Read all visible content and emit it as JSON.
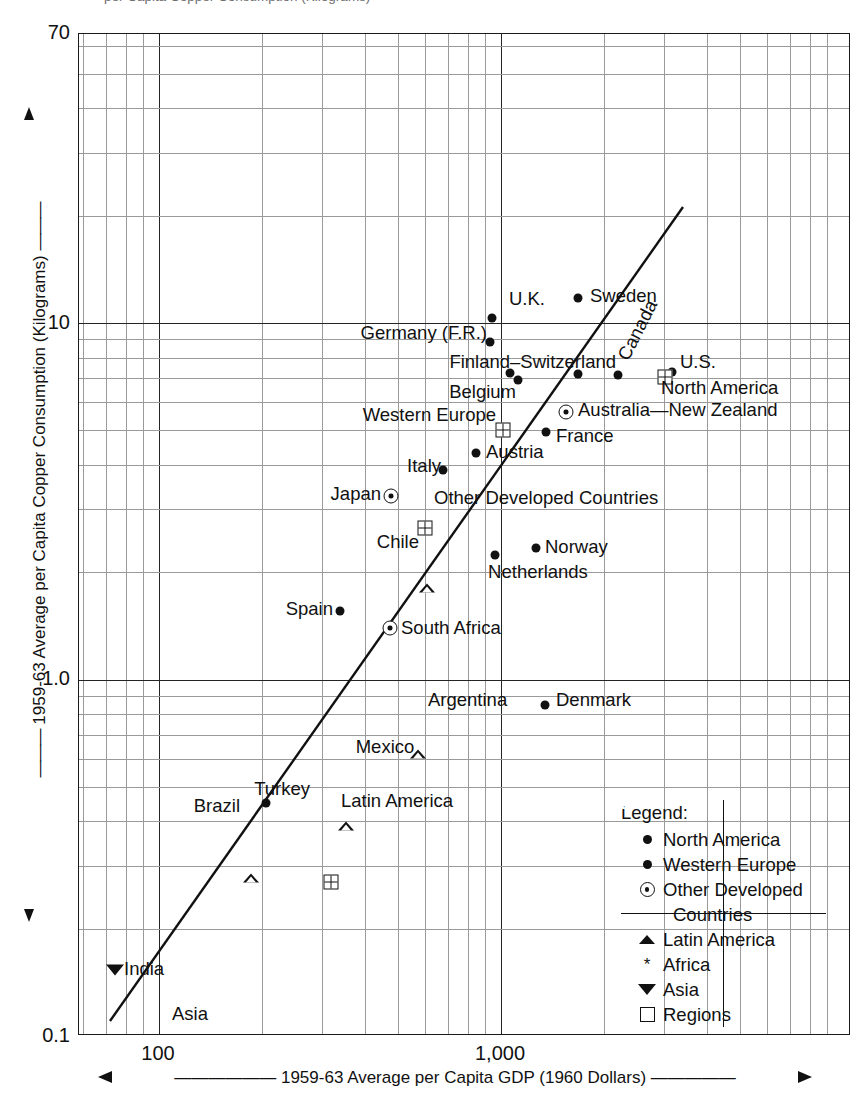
{
  "title_clipped": "per Capita Copper Consumption (Kilograms)",
  "axes": {
    "y_title": "1959-63 Average per Capita Copper Consumption (Kilograms)",
    "x_title": "1959-63 Average per Capita GDP (1960 Dollars)",
    "y_ticks": [
      "70",
      "10",
      "1.0",
      "0.1"
    ],
    "x_ticks": [
      "100",
      "1,000"
    ]
  },
  "legend": {
    "title": "Legend:",
    "items": [
      {
        "symbol": "filled-circle",
        "label": "North America"
      },
      {
        "symbol": "filled-circle",
        "label": "Western Europe"
      },
      {
        "symbol": "circle-dot",
        "label": "Other Developed"
      },
      {
        "symbol": "none",
        "label": "Countries"
      },
      {
        "symbol": "open-triangle",
        "label": "Latin America"
      },
      {
        "symbol": "asterisk",
        "label": "Africa"
      },
      {
        "symbol": "down-triangle",
        "label": "Asia"
      },
      {
        "symbol": "crossed-square",
        "label": "Regions"
      }
    ]
  },
  "chart_data": {
    "type": "scatter",
    "xlabel": "1959-63 Average per Capita GDP (1960 Dollars)",
    "ylabel": "1959-63 Average per Capita Copper Consumption (Kilograms)",
    "xscale": "log",
    "yscale": "log",
    "xlim": [
      72,
      3100
    ],
    "ylim": [
      0.1,
      70
    ],
    "grid": true,
    "legend_position": "inside-bottom-right",
    "trendline": {
      "x": [
        78,
        1840
      ],
      "y": [
        0.107,
        22.0
      ]
    },
    "points": [
      {
        "name": "Sweden",
        "group": "Western Europe",
        "symbol": "filled-circle",
        "x": 1600,
        "y": 11.3
      },
      {
        "name": "U.K.",
        "group": "Western Europe",
        "symbol": "filled-circle",
        "x": 1240,
        "y": 10.0
      },
      {
        "name": "Germany (F.R.)",
        "group": "Western Europe",
        "symbol": "filled-circle",
        "x": 1240,
        "y": 8.6
      },
      {
        "name": "Finland",
        "group": "Western Europe",
        "symbol": "filled-circle",
        "x": 1010,
        "y": 7.3
      },
      {
        "name": "Belgium",
        "group": "Western Europe",
        "symbol": "filled-circle",
        "x": 1070,
        "y": 7.0
      },
      {
        "name": "Switzerland",
        "group": "Western Europe",
        "symbol": "filled-circle",
        "x": 1400,
        "y": 7.2
      },
      {
        "name": "Canada",
        "group": "North America",
        "symbol": "filled-circle",
        "x": 1790,
        "y": 7.2
      },
      {
        "name": "U.S.",
        "group": "North America",
        "symbol": "filled-circle",
        "x": 2450,
        "y": 7.4
      },
      {
        "name": "North America",
        "group": "Regions",
        "symbol": "crossed-square",
        "x": 2330,
        "y": 7.0
      },
      {
        "name": "Western Europe",
        "group": "Regions",
        "symbol": "crossed-square",
        "x": 1070,
        "y": 5.7
      },
      {
        "name": "Australia-New Zealand",
        "group": "Other Developed",
        "symbol": "circle-dot",
        "x": 1540,
        "y": 5.7
      },
      {
        "name": "France",
        "group": "Western Europe",
        "symbol": "filled-circle",
        "x": 1460,
        "y": 5.0
      },
      {
        "name": "Austria",
        "group": "Western Europe",
        "symbol": "filled-circle",
        "x": 1000,
        "y": 4.2
      },
      {
        "name": "Italy",
        "group": "Western Europe",
        "symbol": "filled-circle",
        "x": 780,
        "y": 3.6
      },
      {
        "name": "Japan",
        "group": "Other Developed",
        "symbol": "circle-dot",
        "x": 490,
        "y": 3.2
      },
      {
        "name": "Other Developed Countries",
        "group": "Regions",
        "symbol": "crossed-square",
        "x": 640,
        "y": 3.2
      },
      {
        "name": "Chile",
        "group": "Latin America",
        "symbol": "open-triangle",
        "x": 560,
        "y": 2.35
      },
      {
        "name": "Norway",
        "group": "Western Europe",
        "symbol": "filled-circle",
        "x": 1260,
        "y": 2.35
      },
      {
        "name": "Netherlands",
        "group": "Western Europe",
        "symbol": "filled-circle",
        "x": 960,
        "y": 2.15
      },
      {
        "name": "Spain",
        "group": "Western Europe",
        "symbol": "filled-circle",
        "x": 350,
        "y": 1.55
      },
      {
        "name": "South Africa",
        "group": "Other Developed",
        "symbol": "circle-dot",
        "x": 430,
        "y": 1.33
      },
      {
        "name": "Argentina",
        "group": "Latin America",
        "symbol": "open-triangle",
        "x": 500,
        "y": 0.9
      },
      {
        "name": "Denmark",
        "group": "Western Europe",
        "symbol": "filled-circle",
        "x": 930,
        "y": 0.86
      },
      {
        "name": "Mexico",
        "group": "Latin America",
        "symbol": "open-triangle",
        "x": 345,
        "y": 0.62
      },
      {
        "name": "Turkey",
        "group": "Other",
        "symbol": "filled-circle",
        "x": 230,
        "y": 0.5
      },
      {
        "name": "Brazil",
        "group": "Latin America",
        "symbol": "open-triangle",
        "x": 207,
        "y": 0.49
      },
      {
        "name": "Latin America",
        "group": "Regions",
        "symbol": "crossed-square",
        "x": 330,
        "y": 0.5
      },
      {
        "name": "India",
        "group": "Asia",
        "symbol": "down-triangle",
        "x": 105,
        "y": 0.155
      },
      {
        "name": "Asia",
        "group": "Regions",
        "symbol": "crossed-square",
        "x": 100,
        "y": 0.1
      }
    ]
  },
  "labels": {
    "sweden": "Sweden",
    "uk": "U.K.",
    "germany": "Germany (F.R.)",
    "finland": "Finland",
    "switzerland": "Switzerland",
    "belgium": "Belgium",
    "canada": "Canada",
    "us": "U.S.",
    "north_america": "North America",
    "western_europe": "Western Europe",
    "australia_nz": "Australia—New Zealand",
    "france": "France",
    "austria": "Austria",
    "italy": "Italy",
    "japan": "Japan",
    "other_developed": "Other Developed Countries",
    "chile": "Chile",
    "norway": "Norway",
    "netherlands": "Netherlands",
    "spain": "Spain",
    "south_africa": "South Africa",
    "argentina": "Argentina",
    "denmark": "Denmark",
    "mexico": "Mexico",
    "turkey": "Turkey",
    "brazil": "Brazil",
    "latin_america": "Latin America",
    "india": "India",
    "asia": "Asia",
    "finland_switzerland": "Finland–Switzerland"
  }
}
